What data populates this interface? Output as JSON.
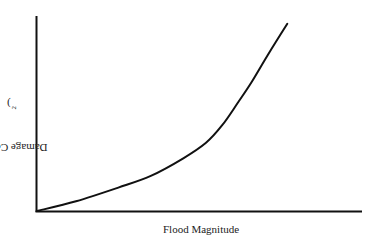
{
  "chart_data": {
    "type": "line",
    "title": "",
    "xlabel": "Flood Magnitude",
    "ylabel": "Damage Costs (C",
    "ylabel_subscript": "2",
    "ylabel_close": ")",
    "grid": false,
    "legend": null,
    "ticks": false,
    "series": [
      {
        "name": "Damage cost curve",
        "x": [
          0.0,
          0.12,
          0.25,
          0.35,
          0.45,
          0.52,
          0.57,
          0.62,
          0.66,
          0.71,
          0.77
        ],
        "y": [
          0.0,
          0.05,
          0.12,
          0.18,
          0.27,
          0.35,
          0.44,
          0.56,
          0.66,
          0.8,
          0.96
        ]
      }
    ]
  },
  "colors": {
    "axis": "#111111",
    "curve": "#111111",
    "background": "#ffffff"
  }
}
